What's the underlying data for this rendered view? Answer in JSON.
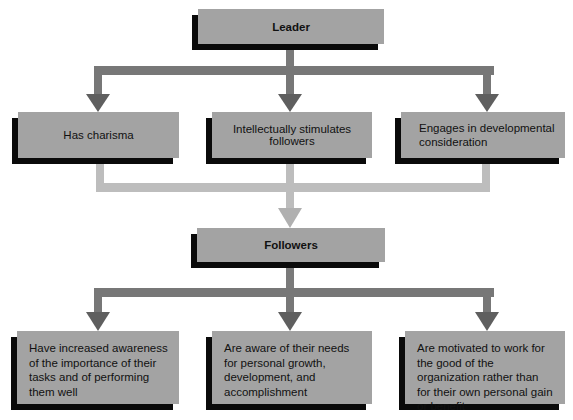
{
  "diagram": {
    "leader": {
      "label": "Leader"
    },
    "leader_behaviors": [
      {
        "label": "Has charisma"
      },
      {
        "label": "Intellectually stimulates followers"
      },
      {
        "label": "Engages in developmental consideration"
      }
    ],
    "followers": {
      "label": "Followers"
    },
    "follower_outcomes": [
      {
        "label": "Have increased awareness of the importance of their tasks and of performing them well"
      },
      {
        "label": "Are aware of their needs for personal growth, development, and accomplishment"
      },
      {
        "label": "Are motivated to work for the good of the organization rather than for their own personal gain or benefit"
      }
    ],
    "colors": {
      "box_fill": "#a3a3a3",
      "box_shadow": "#0a0a0a",
      "arrow_dark": "#6b6b6b",
      "connector_light": "#bdbdbd"
    }
  }
}
